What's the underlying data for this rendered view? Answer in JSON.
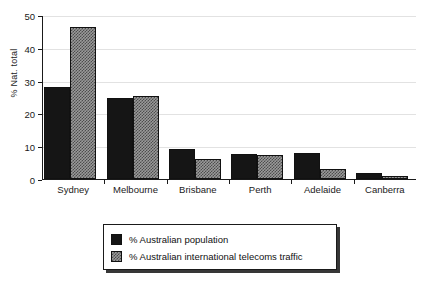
{
  "chart_data": {
    "type": "bar",
    "title": "",
    "subtitle": "",
    "xlabel": "",
    "ylabel": "% Nat. total",
    "categories": [
      "Sydney",
      "Melbourne",
      "Brisbane",
      "Perth",
      "Adelaide",
      "Canberra"
    ],
    "series": [
      {
        "name": "% Australian population",
        "color": "#151515",
        "values": [
          28,
          24.7,
          9.3,
          7.5,
          7.8,
          1.8
        ]
      },
      {
        "name": "% Australian international telecoms traffic",
        "color": "#9a9a9a",
        "values": [
          46.3,
          25.2,
          6.0,
          7.4,
          3.1,
          1.0
        ]
      }
    ],
    "ylim": [
      0,
      50
    ],
    "yticks": [
      0,
      10,
      20,
      30,
      40,
      50
    ],
    "ytick_labels": [
      "0",
      "10",
      "20",
      "30",
      "40",
      "50"
    ],
    "grid": true,
    "grid_axis": "y",
    "legend_position": "below-center",
    "bar_style": "grouped"
  },
  "legend": {
    "entries": [
      {
        "label": "% Australian population"
      },
      {
        "label": "% Australian international telecoms traffic"
      }
    ]
  }
}
